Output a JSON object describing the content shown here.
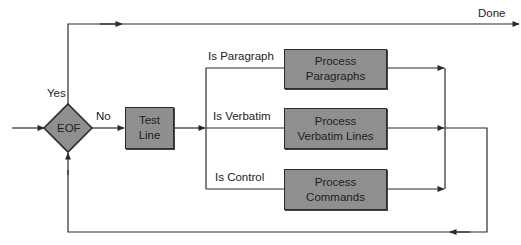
{
  "diagram": {
    "type": "flowchart",
    "decision": {
      "label": "EOF",
      "yes_label": "Yes",
      "no_label": "No"
    },
    "nodes": {
      "test_line": [
        "Test",
        "Line"
      ],
      "process_paragraphs": [
        "Process",
        "Paragraphs"
      ],
      "process_verbatim": [
        "Process",
        "Verbatim Lines"
      ],
      "process_commands": [
        "Process",
        "Commands"
      ]
    },
    "branches": {
      "paragraph": "Is Paragraph",
      "verbatim": "Is Verbatim",
      "control": "Is Control"
    },
    "exit_label": "Done",
    "colors": {
      "box_fill": "#8f8f8f",
      "line": "#2b2b2b",
      "background": "#ffffff"
    }
  }
}
